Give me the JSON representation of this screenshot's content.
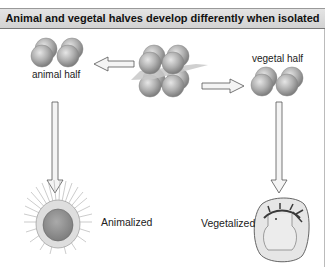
{
  "title": "Animal and vegetal halves develop differently when isolated",
  "labels": {
    "animal_half": "animal half",
    "vegetal_half": "vegetal half",
    "animalized": "Animalized",
    "vegetalized": "Vegetalized"
  },
  "colors": {
    "title_bg": "#d8d8d8",
    "cell_gray": "#a9a9a9",
    "plane_gray": "#c8c8c8",
    "arrow_fill": "#f4f4f4",
    "arrow_stroke": "#555555",
    "embryo_core": "#8e8e8e",
    "embryo_outline": "#666666",
    "gut_dark": "#3a3a3a"
  }
}
